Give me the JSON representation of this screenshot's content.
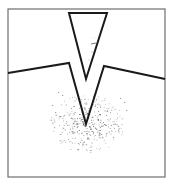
{
  "figure": {
    "canvas": {
      "width": 171,
      "height": 183
    },
    "colors": {
      "background": "#ffffff",
      "frame": "#6e6e6e",
      "line": "#1a1a1a",
      "stipple": "#3a3a3a"
    },
    "frame": {
      "x": 8,
      "y": 9,
      "width": 157,
      "height": 168
    },
    "indenter": {
      "label": "indenter",
      "points": [
        [
          69,
          13
        ],
        [
          107,
          13
        ],
        [
          86,
          79
        ]
      ]
    },
    "surface": {
      "label": "deformed surface",
      "points": [
        [
          8,
          73
        ],
        [
          69,
          63
        ],
        [
          86,
          124
        ],
        [
          104,
          66
        ],
        [
          165,
          79
        ]
      ]
    },
    "deformation_zone": {
      "label": "stippled deformation zone",
      "center": [
        87,
        132
      ],
      "rx": 34,
      "ry": 22
    }
  }
}
